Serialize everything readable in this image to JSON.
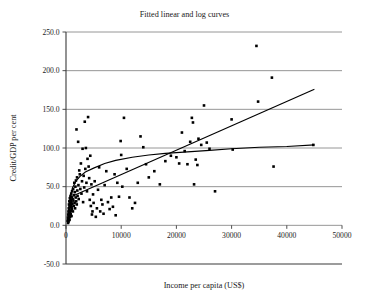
{
  "chart_data": {
    "type": "scatter",
    "title": "Fitted linear and log curves",
    "xlabel": "Income per capita (US$)",
    "ylabel": "Credit/GDP per cent",
    "xlim": [
      0,
      50000
    ],
    "ylim": [
      -50.0,
      250.0
    ],
    "grid": true,
    "legend": "none",
    "xticks": [
      "0",
      "10000",
      "20000",
      "30000",
      "40000",
      "50000"
    ],
    "xtick_values": [
      0,
      10000,
      20000,
      30000,
      40000,
      50000
    ],
    "yticks": [
      "250.0",
      "200.0",
      "150.0",
      "100.0",
      "50.0",
      "0.0",
      "-50.0"
    ],
    "ytick_values": [
      250,
      200,
      150,
      100,
      50,
      0,
      -50
    ],
    "series": [
      {
        "name": "Countries",
        "type": "scatter",
        "marker": "square",
        "color": "#000000",
        "points": [
          [
            300,
            6
          ],
          [
            350,
            10
          ],
          [
            380,
            3
          ],
          [
            400,
            14
          ],
          [
            420,
            8
          ],
          [
            450,
            18
          ],
          [
            470,
            5
          ],
          [
            500,
            22
          ],
          [
            520,
            12
          ],
          [
            540,
            27
          ],
          [
            560,
            16
          ],
          [
            580,
            9
          ],
          [
            600,
            31
          ],
          [
            620,
            20
          ],
          [
            640,
            7
          ],
          [
            660,
            25
          ],
          [
            680,
            13
          ],
          [
            700,
            35
          ],
          [
            720,
            17
          ],
          [
            750,
            11
          ],
          [
            770,
            29
          ],
          [
            800,
            23
          ],
          [
            820,
            38
          ],
          [
            850,
            15
          ],
          [
            880,
            33
          ],
          [
            900,
            26
          ],
          [
            920,
            19
          ],
          [
            950,
            41
          ],
          [
            980,
            30
          ],
          [
            1000,
            12
          ],
          [
            1020,
            24
          ],
          [
            1050,
            36
          ],
          [
            1080,
            21
          ],
          [
            1100,
            44
          ],
          [
            1150,
            28
          ],
          [
            1200,
            34
          ],
          [
            1250,
            18
          ],
          [
            1300,
            47
          ],
          [
            1350,
            32
          ],
          [
            1400,
            25
          ],
          [
            1450,
            39
          ],
          [
            1500,
            55
          ],
          [
            1550,
            29
          ],
          [
            1600,
            43
          ],
          [
            1650,
            22
          ],
          [
            1700,
            50
          ],
          [
            1750,
            36
          ],
          [
            1800,
            58
          ],
          [
            1850,
            31
          ],
          [
            1900,
            124
          ],
          [
            1950,
            27
          ],
          [
            2000,
            62
          ],
          [
            2050,
            45
          ],
          [
            2100,
            38
          ],
          [
            2200,
            108
          ],
          [
            2250,
            52
          ],
          [
            2300,
            34
          ],
          [
            2400,
            71
          ],
          [
            2500,
            66
          ],
          [
            2600,
            47
          ],
          [
            2700,
            80
          ],
          [
            2800,
            41
          ],
          [
            2900,
            57
          ],
          [
            3000,
            99
          ],
          [
            3100,
            30
          ],
          [
            3200,
            64
          ],
          [
            3300,
            49
          ],
          [
            3400,
            134
          ],
          [
            3500,
            73
          ],
          [
            3600,
            100
          ],
          [
            3700,
            55
          ],
          [
            3800,
            44
          ],
          [
            3900,
            86
          ],
          [
            4000,
            140
          ],
          [
            4100,
            76
          ],
          [
            4200,
            61
          ],
          [
            4300,
            33
          ],
          [
            4400,
            90
          ],
          [
            4500,
            25
          ],
          [
            4600,
            53
          ],
          [
            4700,
            14
          ],
          [
            4800,
            18
          ],
          [
            4900,
            40
          ],
          [
            5000,
            29
          ],
          [
            5200,
            57
          ],
          [
            5400,
            11
          ],
          [
            5600,
            22
          ],
          [
            5800,
            46
          ],
          [
            6000,
            75
          ],
          [
            6200,
            18
          ],
          [
            6400,
            33
          ],
          [
            6600,
            27
          ],
          [
            6800,
            15
          ],
          [
            7000,
            52
          ],
          [
            7300,
            70
          ],
          [
            7600,
            30
          ],
          [
            7900,
            21
          ],
          [
            8200,
            36
          ],
          [
            8500,
            24
          ],
          [
            8800,
            66
          ],
          [
            9000,
            13
          ],
          [
            9300,
            55
          ],
          [
            9600,
            37
          ],
          [
            9900,
            109
          ],
          [
            10000,
            91
          ],
          [
            10200,
            50
          ],
          [
            10500,
            139
          ],
          [
            11000,
            73
          ],
          [
            11500,
            36
          ],
          [
            12000,
            22
          ],
          [
            12500,
            29
          ],
          [
            13000,
            55
          ],
          [
            13500,
            115
          ],
          [
            14000,
            101
          ],
          [
            14500,
            79
          ],
          [
            15000,
            62
          ],
          [
            16000,
            70
          ],
          [
            17000,
            53
          ],
          [
            18000,
            83
          ],
          [
            19000,
            90
          ],
          [
            20000,
            88
          ],
          [
            20500,
            80
          ],
          [
            21000,
            120
          ],
          [
            21500,
            96
          ],
          [
            22000,
            79
          ],
          [
            22500,
            108
          ],
          [
            22800,
            139
          ],
          [
            23000,
            133
          ],
          [
            23200,
            53
          ],
          [
            23500,
            85
          ],
          [
            23800,
            78
          ],
          [
            24000,
            112
          ],
          [
            24500,
            104
          ],
          [
            25000,
            155
          ],
          [
            25500,
            107
          ],
          [
            26000,
            99
          ],
          [
            27000,
            44
          ],
          [
            30000,
            137
          ],
          [
            30200,
            98
          ],
          [
            34500,
            232
          ],
          [
            34800,
            160
          ],
          [
            37300,
            191
          ],
          [
            37600,
            76
          ],
          [
            44800,
            104
          ]
        ]
      },
      {
        "name": "Fitted linear curve",
        "type": "line",
        "color": "#000000",
        "points": [
          [
            600,
            36
          ],
          [
            45000,
            176
          ]
        ]
      },
      {
        "name": "Fitted log curve",
        "type": "line",
        "color": "#000000",
        "points": [
          [
            300,
            5
          ],
          [
            500,
            22
          ],
          [
            800,
            38
          ],
          [
            1200,
            49
          ],
          [
            1800,
            57
          ],
          [
            2500,
            63
          ],
          [
            3500,
            69
          ],
          [
            5000,
            74
          ],
          [
            7000,
            80
          ],
          [
            9000,
            84
          ],
          [
            12000,
            88
          ],
          [
            15000,
            91
          ],
          [
            18000,
            93
          ],
          [
            22000,
            95
          ],
          [
            26000,
            97
          ],
          [
            30000,
            99
          ],
          [
            35000,
            101
          ],
          [
            40000,
            102
          ],
          [
            45000,
            104
          ]
        ]
      }
    ]
  },
  "axes": {
    "title": "Fitted linear and log curves",
    "x_axis_label": "Income per capita (US$)",
    "y_axis_label": "Credit/GDP per cent"
  }
}
